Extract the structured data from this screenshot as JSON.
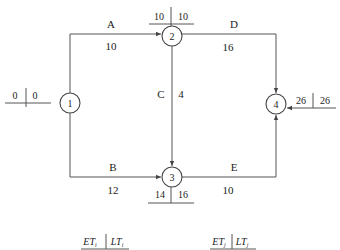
{
  "diagram": {
    "type": "activity-on-arrow network",
    "nodes": [
      {
        "id": "1",
        "label": "1",
        "ET": "0",
        "LT": "0"
      },
      {
        "id": "2",
        "label": "2",
        "ET": "10",
        "LT": "10"
      },
      {
        "id": "3",
        "label": "3",
        "ET": "14",
        "LT": "16"
      },
      {
        "id": "4",
        "label": "4",
        "ET": "26",
        "LT": "26"
      }
    ],
    "edges": [
      {
        "activity": "A",
        "from": "1",
        "to": "2",
        "duration": "10"
      },
      {
        "activity": "B",
        "from": "1",
        "to": "3",
        "duration": "12"
      },
      {
        "activity": "C",
        "from": "2",
        "to": "3",
        "duration": "4"
      },
      {
        "activity": "D",
        "from": "2",
        "to": "4",
        "duration": "16"
      },
      {
        "activity": "E",
        "from": "3",
        "to": "4",
        "duration": "10"
      }
    ],
    "legend": {
      "left": {
        "et": "ET",
        "et_sub": "i",
        "lt": "LT",
        "lt_sub": "i"
      },
      "right": {
        "et": "ET",
        "et_sub": "j",
        "lt": "LT",
        "lt_sub": "j"
      }
    },
    "colors": {
      "line": "#555555",
      "text": "#222222",
      "background": "#ffffff"
    }
  }
}
